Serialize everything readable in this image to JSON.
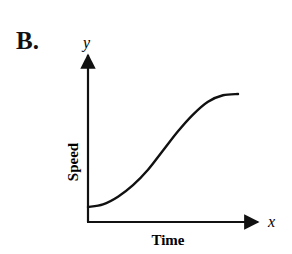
{
  "panel_label": "B.",
  "chart_data": {
    "type": "line",
    "title": "",
    "xlabel": "Time",
    "ylabel": "Speed",
    "x_axis_variable": "x",
    "y_axis_variable": "y",
    "grid": false,
    "legend": null,
    "ticks": "none",
    "x": [
      0,
      0.1,
      0.2,
      0.3,
      0.4,
      0.5,
      0.6,
      0.7,
      0.8,
      0.9,
      1.0
    ],
    "series": [
      {
        "name": "Speed",
        "values": [
          0.08,
          0.1,
          0.16,
          0.25,
          0.37,
          0.52,
          0.67,
          0.8,
          0.9,
          0.95,
          0.96
        ]
      }
    ],
    "xlim": [
      0,
      1.2
    ],
    "ylim": [
      0,
      1.05
    ],
    "color": "#111111"
  }
}
